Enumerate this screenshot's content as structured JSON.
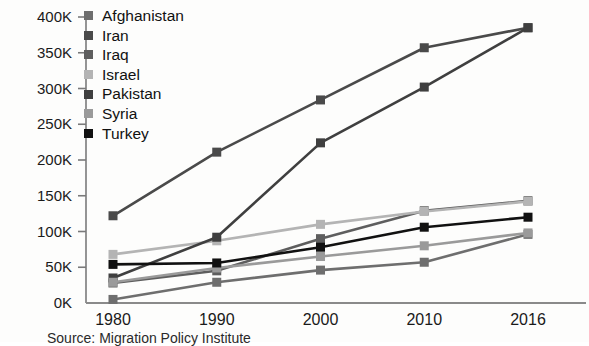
{
  "chart_data": {
    "type": "line",
    "title": "",
    "xlabel": "",
    "ylabel": "",
    "categories": [
      "1980",
      "1990",
      "2000",
      "2010",
      "2016"
    ],
    "x": [
      1980,
      1990,
      2000,
      2010,
      2016
    ],
    "ylim": [
      0,
      400000
    ],
    "ytick_values": [
      0,
      50000,
      100000,
      150000,
      200000,
      250000,
      300000,
      350000,
      400000
    ],
    "ytick_labels": [
      "0K",
      "50K",
      "100K",
      "150K",
      "200K",
      "250K",
      "300K",
      "350K",
      "400K"
    ],
    "grid": false,
    "legend_position": "top-left-inside",
    "markers": "square",
    "series": [
      {
        "name": "Afghanistan",
        "color": "#6e6e6e",
        "values": [
          5000,
          29000,
          46000,
          57000,
          96000
        ]
      },
      {
        "name": "Iran",
        "color": "#4a4a4a",
        "values": [
          122000,
          211000,
          284000,
          357000,
          385000
        ]
      },
      {
        "name": "Iraq",
        "color": "#5e5e5e",
        "values": [
          28000,
          45000,
          90000,
          129000,
          143000
        ]
      },
      {
        "name": "Israel",
        "color": "#b4b4b4",
        "values": [
          68000,
          87000,
          110000,
          128000,
          142000
        ]
      },
      {
        "name": "Pakistan",
        "color": "#3f3f3f",
        "values": [
          35000,
          92000,
          224000,
          302000,
          385000
        ]
      },
      {
        "name": "Syria",
        "color": "#9a9a9a",
        "values": [
          29000,
          49000,
          65000,
          80000,
          98000
        ]
      },
      {
        "name": "Turkey",
        "color": "#111111",
        "values": [
          54000,
          56000,
          78000,
          106000,
          120000
        ]
      }
    ]
  },
  "axis": {
    "x_tick_labels": [
      "1980",
      "1990",
      "2000",
      "2010",
      "2016"
    ],
    "y_tick_labels": [
      "400K",
      "350K",
      "300K",
      "250K",
      "200K",
      "150K",
      "100K",
      "50K",
      "0K"
    ]
  },
  "legend": {
    "items": [
      {
        "label": "Afghanistan",
        "color": "#6e6e6e"
      },
      {
        "label": "Iran",
        "color": "#4a4a4a"
      },
      {
        "label": "Iraq",
        "color": "#5e5e5e"
      },
      {
        "label": "Israel",
        "color": "#b4b4b4"
      },
      {
        "label": "Pakistan",
        "color": "#3f3f3f"
      },
      {
        "label": "Syria",
        "color": "#9a9a9a"
      },
      {
        "label": "Turkey",
        "color": "#111111"
      }
    ]
  },
  "caption": {
    "text": "Source: Migration Policy Institute"
  }
}
